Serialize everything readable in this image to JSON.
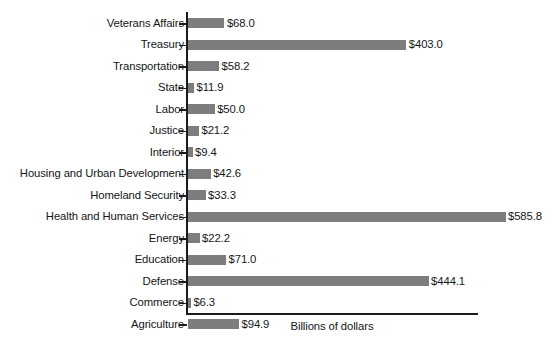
{
  "chart_data": {
    "type": "bar",
    "orientation": "horizontal",
    "title": "",
    "xlabel": "Billions of dollars",
    "ylabel": "",
    "grid": false,
    "legend": null,
    "xlim": [
      0,
      585.8
    ],
    "units": "Billions of dollars",
    "value_prefix": "$",
    "categories": [
      "Veterans Affairs",
      "Treasury",
      "Transportation",
      "State",
      "Labor",
      "Justice",
      "Interior",
      "Housing and Urban Development",
      "Homeland Security",
      "Health and Human Services",
      "Energy",
      "Education",
      "Defense",
      "Commerce",
      "Agriculture"
    ],
    "values": [
      68.0,
      403.0,
      58.2,
      11.9,
      50.0,
      21.2,
      9.4,
      42.6,
      33.3,
      585.8,
      22.2,
      71.0,
      444.1,
      6.3,
      94.9
    ],
    "value_labels": [
      "$68.0",
      "$403.0",
      "$58.2",
      "$11.9",
      "$50.0",
      "$21.2",
      "$9.4",
      "$42.6",
      "$33.3",
      "$585.8",
      "$22.2",
      "$71.0",
      "$444.1",
      "$6.3",
      "$94.9"
    ],
    "colors": {
      "bar": "#7d7d7d",
      "axis": "#1a1a1a",
      "text": "#161616",
      "background": "#ffffff"
    }
  }
}
